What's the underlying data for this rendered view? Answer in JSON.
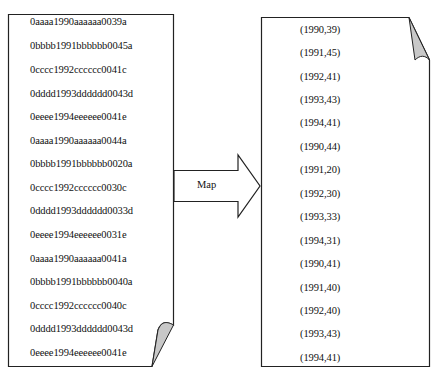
{
  "diagram": {
    "input_document": {
      "lines": [
        "0aaaa1990aaaaaa0039a",
        "0bbbb1991bbbbbb0045a",
        "0cccc1992cccccc0041c",
        "0dddd1993dddddd0043d",
        "0eeee1994eeeeee0041e",
        "0aaaa1990aaaaaa0044a",
        "0bbbb1991bbbbbb0020a",
        "0cccc1992cccccc0030c",
        "0dddd1993dddddd0033d",
        "0eeee1994eeeeee0031e",
        "0aaaa1990aaaaaa0041a",
        "0bbbb1991bbbbbb0040a",
        "0cccc1992cccccc0040c",
        "0dddd1993dddddd0043d",
        "0eeee1994eeeeee0041e"
      ]
    },
    "arrow": {
      "label": "Map"
    },
    "output_document": {
      "lines": [
        "(1990,39)",
        "(1991,45)",
        "(1992,41)",
        "(1993,43)",
        "(1994,41)",
        "(1990,44)",
        "(1991,20)",
        "(1992,30)",
        "(1993,33)",
        "(1994,31)",
        "(1990,41)",
        "(1991,40)",
        "(1992,40)",
        "(1993,43)",
        "(1994,41)"
      ]
    },
    "colors": {
      "stroke": "#222222",
      "fold_fill": "#c8c8c8",
      "background": "#ffffff"
    }
  }
}
